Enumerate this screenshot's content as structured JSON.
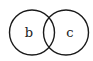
{
  "diagram": {
    "type": "venn",
    "stroke_color": "#1a1a1a",
    "background": "#ffffff",
    "sets": [
      {
        "id": "left",
        "label": "b"
      },
      {
        "id": "right",
        "label": "c"
      }
    ]
  }
}
